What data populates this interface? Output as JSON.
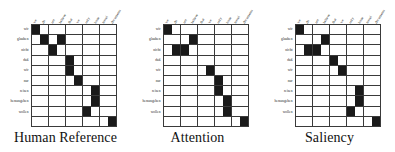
{
  "figure": {
    "kind": "word-alignment-matrices",
    "panel_count": 3,
    "grid_size": 10,
    "colors": {
      "filled": "#1a1a1a",
      "empty": "#ffffff",
      "gridline": "#3a3a3a",
      "text": "#111111"
    }
  },
  "source_words": [
    "wir",
    "glauben",
    "nicht",
    "daß",
    "wir",
    "nur",
    "reisen",
    "herausgeben",
    "wollen",
    ""
  ],
  "target_words": [
    "we",
    "do",
    "not",
    "believe",
    "that",
    "we",
    "only",
    "issue",
    "travel",
    "documents"
  ],
  "chart_data": {
    "type": "heatmap",
    "title": "",
    "xlabel": "",
    "ylabel": "",
    "categories_x": [
      "we",
      "do",
      "not",
      "believe",
      "that",
      "we",
      "only",
      "issue",
      "travel",
      "documents"
    ],
    "categories_y": [
      "wir",
      "glauben",
      "nicht",
      "daß",
      "wir",
      "nur",
      "reisen",
      "herausgeben",
      "wollen",
      ""
    ],
    "legend": [],
    "grid": true,
    "panels": [
      {
        "caption": "Human Reference",
        "values": [
          [
            1,
            0,
            0,
            0,
            0,
            0,
            0,
            0,
            0,
            0
          ],
          [
            0,
            1,
            0,
            1,
            0,
            0,
            0,
            0,
            0,
            0
          ],
          [
            0,
            0,
            1,
            0,
            0,
            0,
            0,
            0,
            0,
            0
          ],
          [
            0,
            0,
            0,
            0,
            1,
            0,
            0,
            0,
            0,
            0
          ],
          [
            0,
            0,
            0,
            0,
            1,
            0,
            0,
            0,
            0,
            0
          ],
          [
            0,
            0,
            0,
            0,
            0,
            1,
            0,
            0,
            0,
            0
          ],
          [
            0,
            0,
            0,
            0,
            0,
            0,
            0,
            1,
            0,
            0
          ],
          [
            0,
            0,
            0,
            0,
            0,
            0,
            0,
            1,
            0,
            0
          ],
          [
            0,
            0,
            0,
            0,
            0,
            0,
            1,
            0,
            0,
            0
          ],
          [
            0,
            0,
            0,
            0,
            0,
            0,
            0,
            0,
            0,
            1
          ]
        ]
      },
      {
        "caption": "Attention",
        "values": [
          [
            1,
            0,
            0,
            0,
            0,
            0,
            0,
            0,
            0,
            0
          ],
          [
            0,
            0,
            0,
            1,
            0,
            0,
            0,
            0,
            0,
            0
          ],
          [
            0,
            1,
            1,
            0,
            0,
            0,
            0,
            0,
            0,
            0
          ],
          [
            0,
            0,
            0,
            0,
            0,
            0,
            0,
            0,
            0,
            0
          ],
          [
            0,
            0,
            0,
            0,
            0,
            1,
            0,
            0,
            0,
            0
          ],
          [
            0,
            0,
            0,
            0,
            0,
            0,
            1,
            0,
            0,
            0
          ],
          [
            0,
            0,
            0,
            0,
            0,
            0,
            1,
            0,
            0,
            0
          ],
          [
            0,
            0,
            0,
            0,
            0,
            0,
            0,
            1,
            0,
            0
          ],
          [
            0,
            0,
            0,
            0,
            0,
            0,
            0,
            1,
            0,
            0
          ],
          [
            0,
            0,
            0,
            0,
            0,
            0,
            0,
            0,
            0,
            1
          ]
        ]
      },
      {
        "caption": "Saliency",
        "values": [
          [
            1,
            0,
            0,
            0,
            0,
            0,
            0,
            0,
            0,
            0
          ],
          [
            0,
            0,
            0,
            1,
            0,
            0,
            0,
            0,
            0,
            0
          ],
          [
            0,
            1,
            1,
            0,
            0,
            0,
            0,
            0,
            0,
            0
          ],
          [
            0,
            0,
            0,
            0,
            1,
            0,
            0,
            0,
            0,
            0
          ],
          [
            0,
            0,
            0,
            0,
            0,
            1,
            0,
            0,
            0,
            0
          ],
          [
            0,
            0,
            0,
            0,
            0,
            0,
            0,
            0,
            0,
            0
          ],
          [
            0,
            0,
            0,
            0,
            0,
            0,
            0,
            1,
            0,
            0
          ],
          [
            0,
            0,
            0,
            0,
            0,
            0,
            0,
            1,
            0,
            0
          ],
          [
            0,
            0,
            0,
            0,
            0,
            0,
            1,
            0,
            0,
            0
          ],
          [
            0,
            0,
            0,
            0,
            0,
            0,
            0,
            0,
            0,
            1
          ]
        ]
      }
    ]
  }
}
